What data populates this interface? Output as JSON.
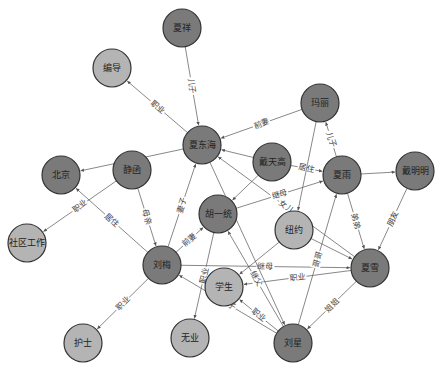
{
  "diagram": {
    "type": "knowledge-graph",
    "colors": {
      "person_node": "#7a7a7a",
      "attribute_node": "#b4b4b4",
      "edge": "#555555",
      "node_border": "#333333"
    },
    "nodes": [
      {
        "id": "xiaxiang",
        "label": "夏祥",
        "kind": "person"
      },
      {
        "id": "bianji",
        "label": "编导",
        "kind": "attribute"
      },
      {
        "id": "huangdonghai",
        "label": "夏东海",
        "kind": "person"
      },
      {
        "id": "mali",
        "label": "玛丽",
        "kind": "person"
      },
      {
        "id": "jinghan",
        "label": "静函",
        "kind": "person"
      },
      {
        "id": "beijing",
        "label": "北京",
        "kind": "person"
      },
      {
        "id": "daitiangao",
        "label": "戴天高",
        "kind": "person"
      },
      {
        "id": "xiayu",
        "label": "夏雨",
        "kind": "person"
      },
      {
        "id": "daiming",
        "label": "戴明明",
        "kind": "person"
      },
      {
        "id": "shequ",
        "label": "社区工作",
        "kind": "attribute"
      },
      {
        "id": "huyitong",
        "label": "胡一统",
        "kind": "person"
      },
      {
        "id": "niuyue",
        "label": "纽约",
        "kind": "attribute"
      },
      {
        "id": "liumei",
        "label": "刘梅",
        "kind": "person"
      },
      {
        "id": "xiaxue",
        "label": "夏雪",
        "kind": "person"
      },
      {
        "id": "xuesheng",
        "label": "学生",
        "kind": "attribute"
      },
      {
        "id": "hushi",
        "label": "护士",
        "kind": "attribute"
      },
      {
        "id": "wuye",
        "label": "无业",
        "kind": "attribute"
      },
      {
        "id": "liuxing",
        "label": "刘星",
        "kind": "person"
      }
    ],
    "edges": [
      {
        "source": "xiaxiang",
        "target": "huangdonghai",
        "label": "儿子"
      },
      {
        "source": "huangdonghai",
        "target": "bianji",
        "label": "职业"
      },
      {
        "source": "mali",
        "target": "huangdonghai",
        "label": "前妻"
      },
      {
        "source": "daitiangao",
        "target": "huangdonghai",
        "label": ""
      },
      {
        "source": "huangdonghai",
        "target": "beijing",
        "label": ""
      },
      {
        "source": "jinghan",
        "target": "shequ",
        "label": "职业"
      },
      {
        "source": "liumei",
        "target": "beijing",
        "label": "居住"
      },
      {
        "source": "jinghan",
        "target": "liumei",
        "label": "母亲"
      },
      {
        "source": "liumei",
        "target": "huangdonghai",
        "label": "妻子"
      },
      {
        "source": "liumei",
        "target": "huyitong",
        "label": "前妻"
      },
      {
        "source": "liumei",
        "target": "hushi",
        "label": "职业"
      },
      {
        "source": "huyitong",
        "target": "wuye",
        "label": "职业"
      },
      {
        "source": "daitiangao",
        "target": "xiayu",
        "label": "居住"
      },
      {
        "source": "xiayu",
        "target": "mali",
        "label": "儿子"
      },
      {
        "source": "xiayu",
        "target": "daiming",
        "label": ""
      },
      {
        "source": "daiming",
        "target": "xiaxue",
        "label": "朋友"
      },
      {
        "source": "xiayu",
        "target": "xiaxue",
        "label": "弟弟"
      },
      {
        "source": "xiaxue",
        "target": "huangdonghai",
        "label": "女儿"
      },
      {
        "source": "huyitong",
        "target": "xiayu",
        "label": "继母"
      },
      {
        "source": "liumei",
        "target": "xiaxue",
        "label": "继母"
      },
      {
        "source": "xiaxue",
        "target": "xuesheng",
        "label": "职业"
      },
      {
        "source": "xiaxue",
        "target": "liuxing",
        "label": "姐姐"
      },
      {
        "source": "liuxing",
        "target": "xiayu",
        "label": "哥哥"
      },
      {
        "source": "liuxing",
        "target": "xuesheng",
        "label": "职业"
      },
      {
        "source": "liuxing",
        "target": "liumei",
        "label": "儿子"
      },
      {
        "source": "liuxing",
        "target": "huyitong",
        "label": "继父"
      },
      {
        "source": "mali",
        "target": "niuyue",
        "label": ""
      },
      {
        "source": "niuyue",
        "target": "xuesheng",
        "label": ""
      },
      {
        "source": "daitiangao",
        "target": "huyitong",
        "label": ""
      },
      {
        "source": "huangdonghai",
        "target": "liuxing",
        "label": ""
      },
      {
        "source": "niuyue",
        "target": "xiaxue",
        "label": ""
      }
    ]
  }
}
